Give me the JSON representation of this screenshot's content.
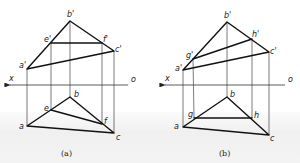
{
  "figures": [
    {
      "id": "a",
      "caption": "(a)",
      "axis": {
        "x_label": "x",
        "o_label": "o",
        "y": 85,
        "x1": 8,
        "x2": 128
      },
      "front_view": {
        "points": {
          "a'": [
            27,
            69
          ],
          "b'": [
            70,
            21
          ],
          "c'": [
            114,
            51
          ],
          "e'": [
            51,
            43
          ],
          "f'": [
            102,
            43
          ]
        },
        "edges": [
          [
            "a'",
            "b'"
          ],
          [
            "b'",
            "c'"
          ],
          [
            "a'",
            "c'"
          ],
          [
            "e'",
            "f'"
          ]
        ]
      },
      "top_view": {
        "points": {
          "a": [
            27,
            126
          ],
          "b": [
            70,
            97
          ],
          "c": [
            114,
            133
          ],
          "e": [
            51,
            110
          ],
          "f": [
            102,
            124
          ]
        },
        "edges": [
          [
            "a",
            "b"
          ],
          [
            "b",
            "c"
          ],
          [
            "a",
            "c"
          ],
          [
            "e",
            "f"
          ]
        ]
      },
      "labels": {
        "a_prime": "a'",
        "b_prime": "b'",
        "c_prime": "c'",
        "e_prime": "e'",
        "f_prime": "f'",
        "a": "a",
        "b": "b",
        "c": "c",
        "e": "e",
        "f": "f"
      }
    },
    {
      "id": "b",
      "caption": "(b)",
      "axis": {
        "x_label": "x",
        "o_label": "o",
        "y": 85,
        "x1": 163,
        "x2": 285
      },
      "front_view": {
        "points": {
          "a'": [
            183,
            70
          ],
          "b'": [
            227,
            22
          ],
          "c'": [
            269,
            52
          ],
          "g'": [
            193,
            59
          ],
          "h'": [
            252,
            39
          ]
        },
        "edges": [
          [
            "a'",
            "b'"
          ],
          [
            "b'",
            "c'"
          ],
          [
            "a'",
            "c'"
          ],
          [
            "g'",
            "h'"
          ]
        ]
      },
      "top_view": {
        "points": {
          "a": [
            183,
            127
          ],
          "b": [
            227,
            97
          ],
          "c": [
            269,
            135
          ],
          "g": [
            194,
            118
          ],
          "h": [
            252,
            118
          ]
        },
        "edges": [
          [
            "a",
            "b"
          ],
          [
            "b",
            "c"
          ],
          [
            "a",
            "c"
          ],
          [
            "g",
            "h"
          ]
        ]
      },
      "labels": {
        "a_prime": "a'",
        "b_prime": "b'",
        "c_prime": "c'",
        "g_prime": "g'",
        "h_prime": "h'",
        "a": "a",
        "b": "b",
        "c": "c",
        "g": "g",
        "h": "h"
      }
    }
  ]
}
